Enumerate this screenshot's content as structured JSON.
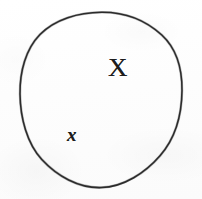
{
  "figure": {
    "kind": "hand-drawn-set-diagram",
    "width": 202,
    "height": 199,
    "background_color": "#fcfcfc",
    "ink_color": "#2b2b2b"
  },
  "shapes": {
    "circle": {
      "name": "set-boundary",
      "center_x": 101,
      "center_y": 100,
      "radius_x": 81,
      "radius_y": 88,
      "stroke_color": "#2b2b2b",
      "stroke_width": 1.55,
      "fill": "none"
    }
  },
  "labels": {
    "set": {
      "text": "X",
      "role": "set-name",
      "x": 108,
      "y": 54,
      "font_size": 27,
      "style": "upright-serif"
    },
    "element": {
      "text": "x",
      "role": "element-name",
      "x": 67,
      "y": 125,
      "font_size": 19,
      "style": "italic-serif"
    }
  }
}
